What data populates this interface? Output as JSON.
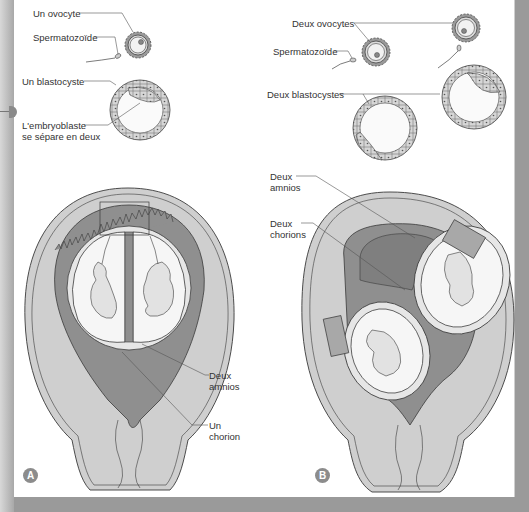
{
  "colors": {
    "uterus_wall": "#cfcfcf",
    "decidua_dark": "#8f8f8f",
    "membrane_light": "#e6e6e6",
    "amniotic_cavity": "#f4f4f4",
    "outline": "#3a3a3a",
    "frame": "#9a9a9a",
    "badge": "#8c8c8c"
  },
  "panel_a": {
    "badge": "A",
    "labels": {
      "ovocyte": "Un ovocyte",
      "sperm": "Spermatozoïde",
      "blastocyst": "Un blastocyste",
      "embryoblast_line1": "L'embryoblaste",
      "embryoblast_line2": "se sépare en deux",
      "amnios_line1": "Deux",
      "amnios_line2": "amnios",
      "chorion_line1": "Un",
      "chorion_line2": "chorion"
    }
  },
  "panel_b": {
    "badge": "B",
    "labels": {
      "ovocytes": "Deux ovocytes",
      "sperm": "Spermatozoïde",
      "blastocysts": "Deux blastocystes",
      "amnios_line1": "Deux",
      "amnios_line2": "amnios",
      "chorions_line1": "Deux",
      "chorions_line2": "chorions"
    }
  }
}
